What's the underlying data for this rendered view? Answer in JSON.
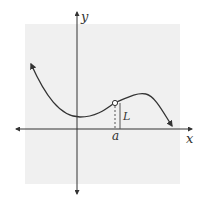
{
  "diagram": {
    "title": "",
    "axes": {
      "x_label": "x",
      "y_label": "y"
    },
    "annotations": {
      "point_label": "a",
      "limit_label": "L"
    },
    "features": {
      "hole": "open circle at (a, L)",
      "left_end": "arrow up-left",
      "right_end": "arrow down-right"
    },
    "colors": {
      "background_panel": "#f0f0f0",
      "curve": "#333333",
      "axes": "#333333",
      "text": "#333333"
    }
  }
}
